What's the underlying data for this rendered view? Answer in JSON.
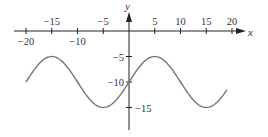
{
  "chart_data": {
    "type": "line",
    "title": "",
    "xlabel": "x",
    "ylabel": "y",
    "xlim": [
      -20,
      20
    ],
    "ylim": [
      -17,
      0
    ],
    "x_ticks": [
      -20,
      -15,
      -10,
      -5,
      5,
      10,
      15,
      20
    ],
    "x_tick_labels": [
      "−20",
      "−15",
      "−10",
      "−5",
      "5",
      "10",
      "15",
      "20"
    ],
    "y_ticks": [
      -5,
      -10,
      -15
    ],
    "y_tick_labels": [
      "−5",
      "−10",
      "−15"
    ],
    "grid": false,
    "legend": null,
    "series": [
      {
        "name": "y = -10 + 5 sin(πx/10)",
        "function": "-10 + 5*sin(pi*x/10)",
        "x_range": [
          -20,
          19
        ],
        "points": [
          {
            "x": -20,
            "y": -10
          },
          {
            "x": -15,
            "y": -5
          },
          {
            "x": -10,
            "y": -10
          },
          {
            "x": -5,
            "y": -15
          },
          {
            "x": 0,
            "y": -10
          },
          {
            "x": 5,
            "y": -5
          },
          {
            "x": 10,
            "y": -10
          },
          {
            "x": 15,
            "y": -15
          },
          {
            "x": 19,
            "y": -11.5
          }
        ],
        "color": "#777777"
      }
    ],
    "axis_color": "#222222"
  },
  "labels": {
    "x_axis": "x",
    "y_axis": "y"
  }
}
